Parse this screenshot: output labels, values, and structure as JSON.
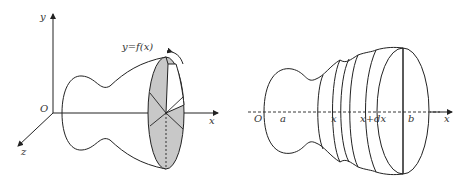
{
  "left_figure": {
    "axis_y_label": "y",
    "axis_x_label": "x",
    "axis_z_label": "z",
    "origin_label": "O",
    "curve_label": "y=f(x)",
    "slice_fill_color": "#c8c8c8"
  },
  "right_figure": {
    "origin_label": "O",
    "a_label": "a",
    "x_label": "x",
    "xdx_label": "x+dx",
    "b_label": "b",
    "axis_x_label": "x"
  }
}
